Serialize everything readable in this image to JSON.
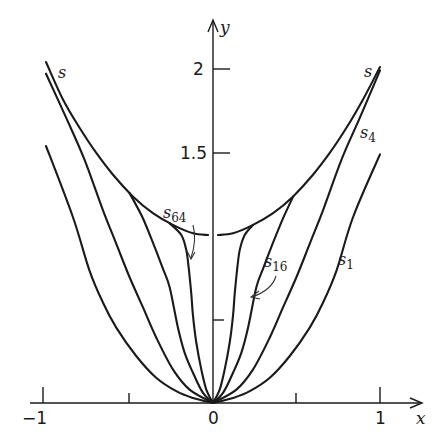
{
  "chart_data": {
    "type": "line",
    "title": "",
    "xlabel": "x",
    "ylabel": "y",
    "xlim": [
      -1.05,
      1.15
    ],
    "ylim": [
      0,
      2.25
    ],
    "grid": false,
    "legend": "inline curve labels",
    "x_ticks": [
      {
        "value": -1,
        "label": "−1"
      },
      {
        "value": -0.5,
        "label": ""
      },
      {
        "value": 0,
        "label": "0"
      },
      {
        "value": 0.5,
        "label": ""
      },
      {
        "value": 1,
        "label": "1"
      }
    ],
    "y_ticks": [
      {
        "value": 1,
        "label": ""
      },
      {
        "value": 1.5,
        "label": "1.5"
      },
      {
        "value": 2,
        "label": "2"
      }
    ],
    "series": [
      {
        "name": "s",
        "label": "s",
        "description": "envelope curve, approx y = 1 + x^2, with a small gap at x = 0",
        "points_right": [
          [
            0.03,
            1.0
          ],
          [
            0.12,
            1.01
          ],
          [
            0.24,
            1.06
          ],
          [
            0.36,
            1.13
          ],
          [
            0.48,
            1.23
          ],
          [
            0.6,
            1.36
          ],
          [
            0.7,
            1.49
          ],
          [
            0.8,
            1.64
          ],
          [
            0.9,
            1.81
          ],
          [
            1.0,
            2.0
          ]
        ],
        "points_left": [
          [
            -0.03,
            1.0
          ],
          [
            -0.12,
            1.01
          ],
          [
            -0.24,
            1.06
          ],
          [
            -0.36,
            1.13
          ],
          [
            -0.48,
            1.23
          ],
          [
            -0.6,
            1.36
          ],
          [
            -0.7,
            1.49
          ],
          [
            -0.8,
            1.64
          ],
          [
            -0.9,
            1.81
          ],
          [
            -1.0,
            2.03
          ]
        ]
      },
      {
        "name": "s64",
        "label": "s",
        "subscript": "64",
        "points_right": [
          [
            0,
            0
          ],
          [
            0.04,
            0.08
          ],
          [
            0.07,
            0.2
          ],
          [
            0.1,
            0.36
          ],
          [
            0.12,
            0.52
          ],
          [
            0.13,
            0.65
          ],
          [
            0.145,
            0.8
          ],
          [
            0.16,
            0.91
          ],
          [
            0.19,
            1.0
          ],
          [
            0.24,
            1.06
          ]
        ],
        "points_left": [
          [
            0,
            0
          ],
          [
            -0.04,
            0.08
          ],
          [
            -0.07,
            0.2
          ],
          [
            -0.1,
            0.36
          ],
          [
            -0.12,
            0.52
          ],
          [
            -0.13,
            0.65
          ],
          [
            -0.145,
            0.8
          ],
          [
            -0.16,
            0.91
          ],
          [
            -0.19,
            1.0
          ],
          [
            -0.26,
            1.07
          ]
        ]
      },
      {
        "name": "s16",
        "label": "s",
        "subscript": "16",
        "points_right": [
          [
            0,
            0
          ],
          [
            0.06,
            0.06
          ],
          [
            0.12,
            0.18
          ],
          [
            0.17,
            0.3
          ],
          [
            0.21,
            0.45
          ],
          [
            0.26,
            0.69
          ],
          [
            0.3,
            0.8
          ],
          [
            0.35,
            0.93
          ],
          [
            0.42,
            1.1
          ],
          [
            0.48,
            1.23
          ]
        ],
        "points_left": [
          [
            0,
            0
          ],
          [
            -0.06,
            0.06
          ],
          [
            -0.12,
            0.18
          ],
          [
            -0.17,
            0.3
          ],
          [
            -0.21,
            0.45
          ],
          [
            -0.26,
            0.69
          ],
          [
            -0.3,
            0.8
          ],
          [
            -0.35,
            0.93
          ],
          [
            -0.42,
            1.1
          ],
          [
            -0.5,
            1.25
          ]
        ]
      },
      {
        "name": "s4",
        "label": "s",
        "subscript": "4",
        "points_right": [
          [
            0,
            0
          ],
          [
            0.14,
            0.08
          ],
          [
            0.24,
            0.2
          ],
          [
            0.34,
            0.39
          ],
          [
            0.42,
            0.57
          ],
          [
            0.5,
            0.75
          ],
          [
            0.58,
            0.95
          ],
          [
            0.66,
            1.15
          ],
          [
            0.77,
            1.45
          ],
          [
            0.88,
            1.7
          ],
          [
            1.0,
            1.98
          ]
        ],
        "points_left": [
          [
            0,
            0
          ],
          [
            -0.14,
            0.08
          ],
          [
            -0.24,
            0.2
          ],
          [
            -0.34,
            0.39
          ],
          [
            -0.42,
            0.57
          ],
          [
            -0.5,
            0.75
          ],
          [
            -0.58,
            0.95
          ],
          [
            -0.66,
            1.15
          ],
          [
            -0.77,
            1.45
          ],
          [
            -0.88,
            1.7
          ],
          [
            -1.0,
            1.96
          ]
        ]
      },
      {
        "name": "s1",
        "label": "s",
        "subscript": "1",
        "points_right": [
          [
            0,
            0
          ],
          [
            0.12,
            0.03
          ],
          [
            0.22,
            0.07
          ],
          [
            0.34,
            0.15
          ],
          [
            0.46,
            0.28
          ],
          [
            0.58,
            0.45
          ],
          [
            0.66,
            0.6
          ],
          [
            0.74,
            0.79
          ],
          [
            0.84,
            1.11
          ],
          [
            1.0,
            1.48
          ]
        ],
        "points_left": [
          [
            0,
            0
          ],
          [
            -0.12,
            0.03
          ],
          [
            -0.22,
            0.07
          ],
          [
            -0.34,
            0.15
          ],
          [
            -0.46,
            0.28
          ],
          [
            -0.58,
            0.45
          ],
          [
            -0.66,
            0.6
          ],
          [
            -0.74,
            0.79
          ],
          [
            -0.84,
            1.11
          ],
          [
            -1.0,
            1.53
          ]
        ]
      }
    ],
    "annotations": [
      {
        "text": "s",
        "position": "upper-left end of envelope"
      },
      {
        "text": "s",
        "position": "upper-right end of envelope"
      },
      {
        "text": "s4",
        "position": "right, near x=0.95, y=1.6"
      },
      {
        "text": "s1",
        "position": "right, near x=0.8, y=0.95"
      },
      {
        "text": "s64",
        "position": "left of y-axis above envelope with arrow pointing to s64 curve"
      },
      {
        "text": "s16",
        "position": "right of y-axis with arrow pointing to s16 curve"
      }
    ]
  },
  "labels": {
    "x_axis_var": "x",
    "y_axis_var": "y",
    "tick_minus1": "−1",
    "tick_0": "0",
    "tick_1": "1",
    "tick_y15": "1.5",
    "tick_y2": "2",
    "s_left": "s",
    "s_right": "s",
    "s4_base": "s",
    "s4_sub": "4",
    "s1_base": "s",
    "s1_sub": "1",
    "s64_base": "s",
    "s64_sub": "64",
    "s16_base": "s",
    "s16_sub": "16"
  },
  "colors": {
    "ink": "#1a1a1a",
    "background": "#ffffff"
  }
}
